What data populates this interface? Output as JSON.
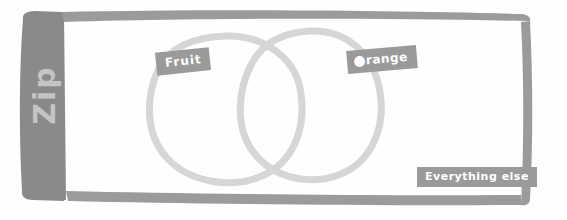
{
  "canvas": {
    "width": 567,
    "height": 220,
    "background": "#fefefe"
  },
  "frame": {
    "name": "hand-drawn-border",
    "color": "#8a8a8a",
    "spine_label": "Zip",
    "spine_label_color": "#c4c4c4"
  },
  "diagram": {
    "type": "venn",
    "stroke_color": "#d6d6d6",
    "circles": [
      {
        "id": "left",
        "label": "Fruit",
        "cx": 226,
        "cy": 108,
        "rx": 76,
        "ry": 72
      },
      {
        "id": "right",
        "label": "Orange",
        "cx": 312,
        "cy": 103,
        "rx": 68,
        "ry": 72
      }
    ]
  },
  "labels": {
    "fruit": "Fruit",
    "orange": "range",
    "orange_full": "Orange",
    "everything_else": "Everything else",
    "background": "#9a9a9a",
    "text_color": "#ffffff"
  }
}
